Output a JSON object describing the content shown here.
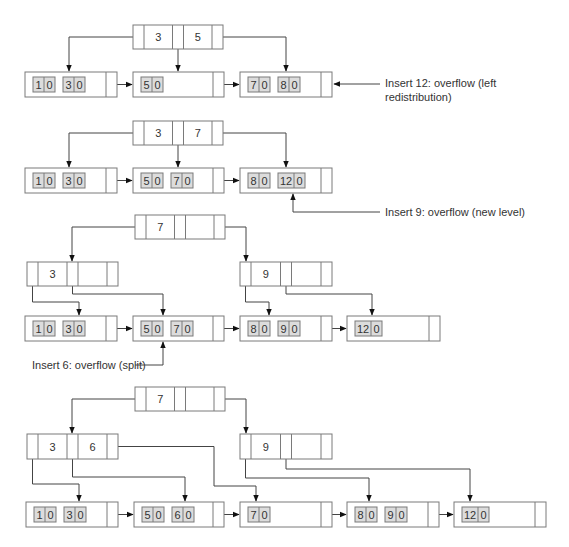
{
  "diagram": {
    "type": "B+ tree insertion sequence",
    "colors": {
      "line": "#7a7a7a",
      "arrow": "#444444",
      "key_fill": "#dcdcdc",
      "background": "#ffffff"
    },
    "stages": [
      {
        "id": "stage1",
        "index_nodes": [
          {
            "id": "s1-root",
            "keys": [
              "3",
              "5"
            ],
            "x": 133,
            "y": 25,
            "w": 90,
            "h": 24
          }
        ],
        "leaf_nodes": [
          {
            "id": "s1-L1",
            "keys": [
              [
                "1",
                "0"
              ],
              [
                "3",
                "0"
              ]
            ],
            "x": 25,
            "y": 72,
            "w": 92,
            "h": 25
          },
          {
            "id": "s1-L2",
            "keys": [
              [
                "5",
                "0"
              ]
            ],
            "x": 133,
            "y": 72,
            "w": 91,
            "h": 25
          },
          {
            "id": "s1-L3",
            "keys": [
              [
                "7",
                "0"
              ],
              [
                "8",
                "0"
              ]
            ],
            "x": 240,
            "y": 72,
            "w": 92,
            "h": 25
          }
        ],
        "annotation": {
          "lines": [
            "Insert 12: overflow (left",
            "redistribution)"
          ],
          "x": 385,
          "y": 87,
          "points_to": "s1-L3"
        }
      },
      {
        "id": "stage2",
        "index_nodes": [
          {
            "id": "s2-root",
            "keys": [
              "3",
              "7"
            ],
            "x": 133,
            "y": 121,
            "w": 90,
            "h": 24
          }
        ],
        "leaf_nodes": [
          {
            "id": "s2-L1",
            "keys": [
              [
                "1",
                "0"
              ],
              [
                "3",
                "0"
              ]
            ],
            "x": 25,
            "y": 168,
            "w": 92,
            "h": 25
          },
          {
            "id": "s2-L2",
            "keys": [
              [
                "5",
                "0"
              ],
              [
                "7",
                "0"
              ]
            ],
            "x": 133,
            "y": 168,
            "w": 91,
            "h": 25
          },
          {
            "id": "s2-L3",
            "keys": [
              [
                "8",
                "0"
              ],
              [
                "12",
                "0"
              ]
            ],
            "x": 240,
            "y": 168,
            "w": 92,
            "h": 25
          }
        ],
        "annotation": {
          "lines": [
            "Insert 9: overflow (new level)"
          ],
          "x": 385,
          "y": 216,
          "points_to": "s2-L3"
        }
      },
      {
        "id": "stage3",
        "index_nodes": [
          {
            "id": "s3-root",
            "keys": [
              "7",
              ""
            ],
            "x": 135,
            "y": 215,
            "w": 90,
            "h": 24
          },
          {
            "id": "s3-left",
            "keys": [
              "3",
              ""
            ],
            "x": 27,
            "y": 262,
            "w": 91,
            "h": 24
          },
          {
            "id": "s3-right",
            "keys": [
              "9",
              ""
            ],
            "x": 240,
            "y": 262,
            "w": 92,
            "h": 24
          }
        ],
        "leaf_nodes": [
          {
            "id": "s3-L1",
            "keys": [
              [
                "1",
                "0"
              ],
              [
                "3",
                "0"
              ]
            ],
            "x": 25,
            "y": 316,
            "w": 92,
            "h": 25
          },
          {
            "id": "s3-L2",
            "keys": [
              [
                "5",
                "0"
              ],
              [
                "7",
                "0"
              ]
            ],
            "x": 133,
            "y": 316,
            "w": 91,
            "h": 25
          },
          {
            "id": "s3-L3",
            "keys": [
              [
                "8",
                "0"
              ],
              [
                "9",
                "0"
              ]
            ],
            "x": 240,
            "y": 316,
            "w": 92,
            "h": 25
          },
          {
            "id": "s3-L4",
            "keys": [
              [
                "12",
                "0"
              ]
            ],
            "x": 347,
            "y": 316,
            "w": 93,
            "h": 25
          }
        ],
        "annotation": {
          "lines": [
            "Insert 6: overflow (split)"
          ],
          "x": 32,
          "y": 369,
          "points_to": "s3-L2"
        }
      },
      {
        "id": "stage4",
        "index_nodes": [
          {
            "id": "s4-root",
            "keys": [
              "7",
              ""
            ],
            "x": 135,
            "y": 387,
            "w": 90,
            "h": 24
          },
          {
            "id": "s4-left",
            "keys": [
              "3",
              "6"
            ],
            "x": 27,
            "y": 434,
            "w": 91,
            "h": 25
          },
          {
            "id": "s4-right",
            "keys": [
              "9",
              ""
            ],
            "x": 240,
            "y": 434,
            "w": 92,
            "h": 25
          }
        ],
        "leaf_nodes": [
          {
            "id": "s4-L1",
            "keys": [
              [
                "1",
                "0"
              ],
              [
                "3",
                "0"
              ]
            ],
            "x": 26,
            "y": 502,
            "w": 92,
            "h": 25
          },
          {
            "id": "s4-L2",
            "keys": [
              [
                "5",
                "0"
              ],
              [
                "6",
                "0"
              ]
            ],
            "x": 134,
            "y": 502,
            "w": 90,
            "h": 25
          },
          {
            "id": "s4-L3",
            "keys": [
              [
                "7",
                "0"
              ]
            ],
            "x": 240,
            "y": 502,
            "w": 92,
            "h": 25
          },
          {
            "id": "s4-L4",
            "keys": [
              [
                "8",
                "0"
              ],
              [
                "9",
                "0"
              ]
            ],
            "x": 347,
            "y": 502,
            "w": 92,
            "h": 25
          },
          {
            "id": "s4-L5",
            "keys": [
              [
                "12",
                "0"
              ]
            ],
            "x": 454,
            "y": 502,
            "w": 92,
            "h": 25
          }
        ],
        "annotation": null
      }
    ]
  }
}
